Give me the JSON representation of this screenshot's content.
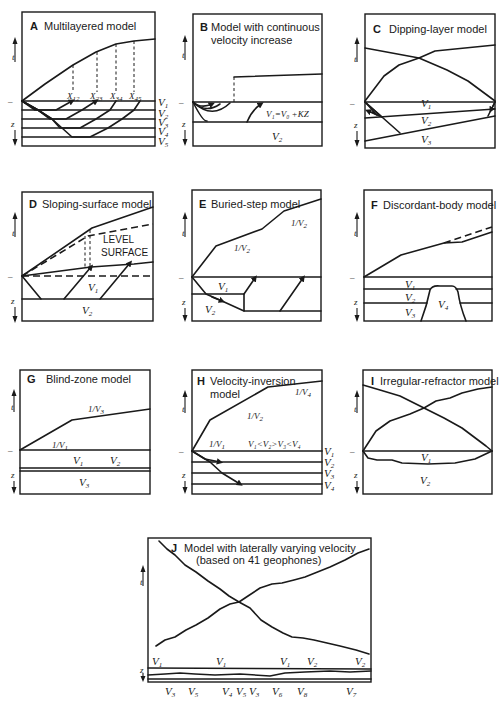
{
  "figure": {
    "axes": {
      "time": "t",
      "depth": "z",
      "surface_tick": "–"
    },
    "panels": [
      {
        "letter": "A",
        "title": "Multilayered model",
        "labels": {
          "x12": "X",
          "x12_sub": "12",
          "x23": "X",
          "x23_sub": "23",
          "x34": "X",
          "x34_sub": "34",
          "x45": "X",
          "x45_sub": "45",
          "v1": "V",
          "v1_sub": "1",
          "v2": "V",
          "v2_sub": "2",
          "v3": "V",
          "v3_sub": "3",
          "v4": "V",
          "v4_sub": "4",
          "v5": "V",
          "v5_sub": "5"
        }
      },
      {
        "letter": "B",
        "title_line1": "Model with continuous",
        "title_line2": "velocity increase",
        "labels": {
          "v1_eq": "V₁=V₀ +KZ",
          "v2": "V",
          "v2_sub": "2"
        }
      },
      {
        "letter": "C",
        "title": "Dipping-layer model",
        "labels": {
          "v1": "V",
          "v1_sub": "1",
          "v2": "V",
          "v2_sub": "2",
          "v3": "V",
          "v3_sub": "3"
        }
      },
      {
        "letter": "D",
        "title": "Sloping-surface model",
        "labels": {
          "level1": "LEVEL",
          "level2": "SURFACE",
          "v1": "V",
          "v1_sub": "1",
          "v2": "V",
          "v2_sub": "2"
        }
      },
      {
        "letter": "E",
        "title": "Buried-step model",
        "labels": {
          "slope_a": "1/V",
          "slope_a_sub": "2",
          "slope_b": "1/V",
          "slope_b_sub": "2",
          "v1": "V",
          "v1_sub": "1",
          "v2": "V",
          "v2_sub": "2"
        }
      },
      {
        "letter": "F",
        "title": "Discordant-body model",
        "labels": {
          "v1": "V",
          "v1_sub": "1",
          "v2": "V",
          "v2_sub": "2",
          "v3": "V",
          "v3_sub": "3",
          "v4": "V",
          "v4_sub": "4"
        }
      },
      {
        "letter": "G",
        "title": "Blind-zone model",
        "labels": {
          "s3": "1/V",
          "s3_sub": "3",
          "s1": "1/V",
          "s1_sub": "1",
          "v1": "V",
          "v1_sub": "1",
          "v2": "V",
          "v2_sub": "2",
          "v3": "V",
          "v3_sub": "3"
        }
      },
      {
        "letter": "H",
        "title_line1": "Velocity-inversion",
        "title_line2": "model",
        "labels": {
          "s4": "1/V",
          "s4_sub": "4",
          "s2": "1/V",
          "s2_sub": "2",
          "s1": "1/V",
          "s1_sub": "1",
          "ineq": "V₁<V₂>V₃<V₄",
          "v1": "V",
          "v1_sub": "1",
          "v2": "V",
          "v2_sub": "2",
          "v3": "V",
          "v3_sub": "3",
          "v4": "V",
          "v4_sub": "4"
        }
      },
      {
        "letter": "I",
        "title": "Irregular-refractor model",
        "labels": {
          "v1": "V",
          "v1_sub": "1",
          "v2": "V",
          "v2_sub": "2"
        }
      },
      {
        "letter": "J",
        "title_line1": "Model with laterally varying velocity",
        "title_line2": "(based on 41 geophones)",
        "top_labels": [
          {
            "t": "V",
            "s": "1"
          },
          {
            "t": "V",
            "s": "1"
          },
          {
            "t": "V",
            "s": "1"
          },
          {
            "t": "V",
            "s": "2"
          },
          {
            "t": "V",
            "s": "2"
          }
        ],
        "bottom_labels": [
          {
            "t": "V",
            "s": "3"
          },
          {
            "t": "V",
            "s": "5"
          },
          {
            "t": "V",
            "s": "4"
          },
          {
            "t": "V",
            "s": "5"
          },
          {
            "t": "V",
            "s": "3"
          },
          {
            "t": "V",
            "s": "6"
          },
          {
            "t": "V",
            "s": "8"
          },
          {
            "t": "V",
            "s": "7"
          }
        ]
      }
    ]
  }
}
